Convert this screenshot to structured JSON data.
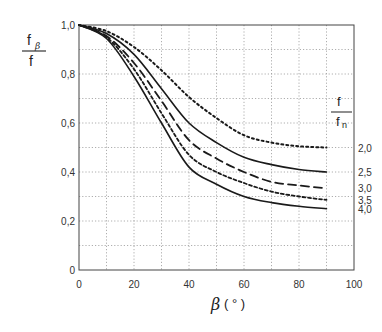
{
  "chart_data": {
    "type": "line",
    "title": "",
    "xlabel": "β (°)",
    "ylabel": "fβ / f",
    "xlim": [
      0,
      100
    ],
    "ylim": [
      0,
      1.0
    ],
    "xticks": [
      0,
      20,
      40,
      60,
      80,
      100
    ],
    "xtick_labels": [
      "0",
      "20",
      "40",
      "60",
      "80",
      "100"
    ],
    "yticks": [
      0,
      0.2,
      0.4,
      0.6,
      0.8,
      1.0
    ],
    "ytick_labels": [
      "0",
      "0,2",
      "0,4",
      "0,6",
      "0,8",
      "1,0"
    ],
    "grid": {
      "x_step": 10,
      "y_step": 0.1,
      "style": "dotted"
    },
    "legend": {
      "title_num": "f",
      "title_den": "fn",
      "position": "right"
    },
    "x": [
      0,
      10,
      20,
      30,
      40,
      50,
      60,
      70,
      80,
      90
    ],
    "series": [
      {
        "name": "2,0",
        "style": "dotted",
        "values": [
          1.0,
          0.975,
          0.91,
          0.815,
          0.706,
          0.62,
          0.55,
          0.52,
          0.505,
          0.5
        ]
      },
      {
        "name": "2,5",
        "style": "solid",
        "values": [
          1.0,
          0.965,
          0.88,
          0.74,
          0.6,
          0.52,
          0.46,
          0.43,
          0.41,
          0.4
        ]
      },
      {
        "name": "3,0",
        "style": "dashed",
        "values": [
          1.0,
          0.955,
          0.845,
          0.69,
          0.53,
          0.455,
          0.4,
          0.36,
          0.345,
          0.333
        ]
      },
      {
        "name": "3,5",
        "style": "shortdash",
        "values": [
          1.0,
          0.95,
          0.82,
          0.64,
          0.47,
          0.4,
          0.355,
          0.32,
          0.3,
          0.286
        ]
      },
      {
        "name": "4,0",
        "style": "solid",
        "values": [
          1.0,
          0.945,
          0.79,
          0.6,
          0.42,
          0.35,
          0.3,
          0.275,
          0.26,
          0.25
        ]
      }
    ]
  },
  "labels": {
    "ylabel_num": "f",
    "ylabel_sub": "β",
    "ylabel_den": "f",
    "xlabel_sym": "β",
    "xlabel_unit": "( ° )",
    "legend_num": "f",
    "legend_den": "f",
    "legend_den_sub": "n"
  }
}
